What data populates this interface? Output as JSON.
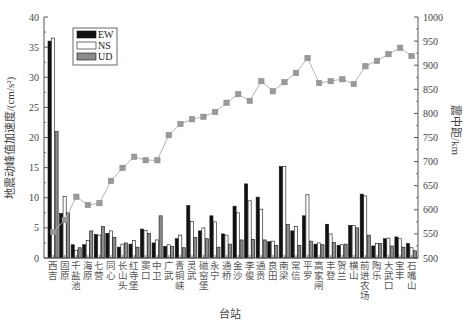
{
  "chart_data": {
    "type": "bar",
    "secondary_type": "line",
    "title": "",
    "xlabel": "台站",
    "ylabel": "地震动峰值加速度/(cm/s²)",
    "ylabel_right": "震中距/km",
    "ylim": [
      0,
      40
    ],
    "ylim_right": [
      500,
      1000
    ],
    "yticks": [
      0,
      5,
      10,
      15,
      20,
      25,
      30,
      35,
      40
    ],
    "yticks_right": [
      500,
      550,
      600,
      650,
      700,
      750,
      800,
      850,
      900,
      950,
      1000
    ],
    "grid": false,
    "legend_position": "upper-left-inside",
    "categories": [
      "西吉",
      "固原",
      "千盐池",
      "海原",
      "七营",
      "同心",
      "长山头",
      "红寺堡",
      "窦口",
      "中卫",
      "广武",
      "青铜峡",
      "灵武",
      "磁窑堡",
      "永宁",
      "通桥",
      "金沙",
      "李俊",
      "通贵",
      "良田",
      "南梁",
      "常信",
      "平罗",
      "高家闸",
      "丰登",
      "贺兰",
      "横山",
      "前进农场",
      "陶乐",
      "大武口",
      "宝丰",
      "石嘴山"
    ],
    "series": [
      {
        "name": "EW",
        "type": "bar",
        "axis": "left",
        "color": "#111111",
        "values": [
          36.0,
          7.4,
          2.2,
          2.2,
          3.9,
          4.1,
          1.8,
          2.3,
          4.8,
          2.5,
          1.9,
          3.2,
          8.7,
          4.5,
          7.0,
          4.0,
          8.6,
          12.3,
          10.1,
          2.7,
          15.2,
          4.5,
          7.0,
          2.3,
          5.6,
          2.1,
          5.4,
          10.6,
          2.0,
          3.2,
          3.5,
          2.4
        ]
      },
      {
        "name": "NS",
        "type": "bar",
        "axis": "left",
        "color": "#ffffff",
        "values": [
          36.5,
          10.2,
          1.3,
          2.9,
          3.8,
          4.5,
          2.3,
          2.9,
          4.6,
          3.0,
          2.2,
          3.8,
          6.1,
          5.0,
          6.0,
          3.8,
          7.5,
          9.5,
          8.1,
          2.8,
          15.2,
          5.2,
          10.5,
          2.5,
          4.0,
          2.2,
          5.4,
          10.3,
          2.4,
          3.3,
          3.2,
          1.7
        ]
      },
      {
        "name": "UD",
        "type": "bar",
        "axis": "left",
        "color": "#8c8c8c",
        "values": [
          21.0,
          7.5,
          1.7,
          4.5,
          5.2,
          3.4,
          2.5,
          1.8,
          4.1,
          7.0,
          1.9,
          1.7,
          3.4,
          3.2,
          1.8,
          2.3,
          3.0,
          3.1,
          3.0,
          2.1,
          5.6,
          2.1,
          2.8,
          2.2,
          2.6,
          2.3,
          5.0,
          3.8,
          2.4,
          2.0,
          1.8,
          1.2
        ]
      },
      {
        "name": "震中距",
        "type": "line",
        "axis": "right",
        "color": "#999999",
        "marker": "square",
        "values": [
          554,
          579,
          627,
          610,
          614,
          660,
          687,
          710,
          703,
          703,
          755,
          778,
          788,
          793,
          803,
          822,
          840,
          826,
          867,
          846,
          865,
          884,
          915,
          863,
          867,
          871,
          861,
          898,
          909,
          923,
          936,
          919
        ]
      }
    ]
  },
  "legend": {
    "items": [
      {
        "label": "EW",
        "color": "#111111"
      },
      {
        "label": "NS",
        "color": "#ffffff"
      },
      {
        "label": "UD",
        "color": "#8c8c8c"
      }
    ]
  },
  "axes": {
    "xlabel": "台站",
    "ylabel_left": "地震动峰值加速度/(cm/s²)",
    "ylabel_right": "震中距/km"
  }
}
